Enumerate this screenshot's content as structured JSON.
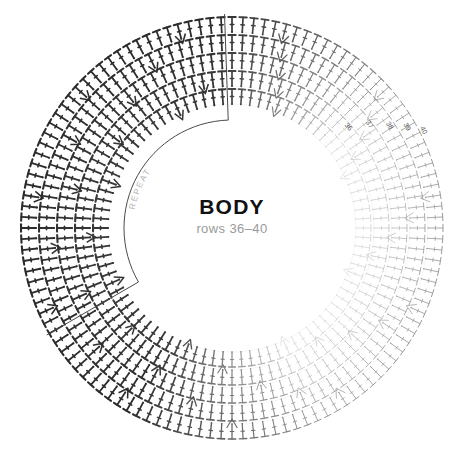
{
  "canvas": {
    "width": 465,
    "height": 463,
    "background": "#ffffff"
  },
  "center": {
    "title": "BODY",
    "subtitle": "rows 36–40",
    "title_color": "#111111",
    "subtitle_color": "#9a9a9a"
  },
  "repeat": {
    "label": "REPEAT",
    "label_color": "#b4b4b4",
    "box_color": "#4a4a4a"
  },
  "row_labels": [
    {
      "text": "36",
      "angle_deg": 41.0,
      "radius": 152
    },
    {
      "text": "37",
      "angle_deg": 37.0,
      "radius": 170
    },
    {
      "text": "38",
      "angle_deg": 33.0,
      "radius": 186
    },
    {
      "text": "39",
      "angle_deg": 30.0,
      "radius": 200
    },
    {
      "text": "40",
      "angle_deg": 27.0,
      "radius": 213
    }
  ],
  "chart_data": {
    "type": "diagram",
    "title": "BODY",
    "subtitle": "rows 36–40",
    "pattern": "circular crochet stitch chart",
    "cx": 232,
    "cy": 228,
    "rings": [
      {
        "row": 36,
        "radius": 124,
        "stitch_count": 88,
        "symbol": "double-crochet",
        "color": "#d9d9d9"
      },
      {
        "row": 37,
        "radius": 142,
        "stitch_count": 96,
        "symbol": "double-crochet",
        "color": "#cccccc"
      },
      {
        "row": 38,
        "radius": 160,
        "stitch_count": 104,
        "symbol": "double-crochet",
        "color": "#bdbdbd"
      },
      {
        "row": 39,
        "radius": 178,
        "stitch_count": 112,
        "symbol": "double-crochet",
        "color": "#aaaaaa"
      },
      {
        "row": 40,
        "radius": 196,
        "stitch_count": 120,
        "symbol": "double-crochet",
        "color": "#999999"
      }
    ],
    "symbols_legend": [
      {
        "name": "double-crochet",
        "glyph": "T"
      },
      {
        "name": "increase-shell",
        "glyph": "V"
      }
    ],
    "repeat_sector": {
      "start_angle_deg": 150,
      "end_angle_deg": 268,
      "inner_radius": 108,
      "outer_radius": 214
    },
    "inner_radius": 108,
    "outer_radius": 214,
    "grid": false,
    "legend_position": "none"
  }
}
